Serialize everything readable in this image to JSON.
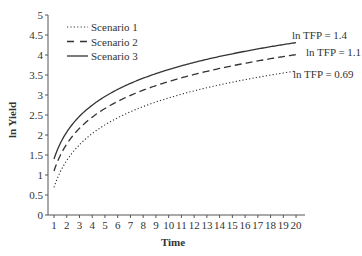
{
  "chart_data": {
    "type": "line",
    "title": "",
    "xlabel": "Time",
    "ylabel": "ln Yield",
    "xlim": [
      1,
      20
    ],
    "ylim": [
      0,
      5
    ],
    "grid": false,
    "legend_position": "top-left",
    "x": [
      1,
      2,
      3,
      4,
      5,
      6,
      7,
      8,
      9,
      10,
      11,
      12,
      13,
      14,
      15,
      16,
      17,
      18,
      19,
      20
    ],
    "x_ticks": [
      "1",
      "2",
      "3",
      "4",
      "5",
      "6",
      "7",
      "8",
      "9",
      "10",
      "11",
      "12",
      "13",
      "14",
      "15",
      "16",
      "17",
      "18",
      "19",
      "20"
    ],
    "y_ticks": [
      "0",
      "0.5",
      "1",
      "1.5",
      "2",
      "2.5",
      "3",
      "3.5",
      "4",
      "4.5",
      "5"
    ],
    "series": [
      {
        "name": "Scenario 1",
        "style": "dotted",
        "annotation": "ln TFP = 0.69",
        "values": [
          0.69,
          1.36,
          1.76,
          2.03,
          2.25,
          2.43,
          2.58,
          2.71,
          2.82,
          2.92,
          3.02,
          3.1,
          3.18,
          3.25,
          3.32,
          3.38,
          3.44,
          3.49,
          3.55,
          3.6
        ]
      },
      {
        "name": "Scenario 2",
        "style": "dashed",
        "annotation": "ln TFP = 1.1",
        "values": [
          1.1,
          1.77,
          2.17,
          2.44,
          2.66,
          2.84,
          2.99,
          3.12,
          3.23,
          3.33,
          3.43,
          3.51,
          3.59,
          3.66,
          3.73,
          3.79,
          3.85,
          3.9,
          3.96,
          4.01
        ]
      },
      {
        "name": "Scenario 3",
        "style": "solid",
        "annotation": "ln TFP = 1.4",
        "values": [
          1.4,
          2.07,
          2.47,
          2.74,
          2.96,
          3.14,
          3.29,
          3.42,
          3.53,
          3.63,
          3.73,
          3.81,
          3.89,
          3.96,
          4.03,
          4.09,
          4.15,
          4.2,
          4.26,
          4.31
        ]
      }
    ]
  },
  "colors": {
    "line": "#333333",
    "axis": "#555555",
    "background": "#ffffff"
  }
}
